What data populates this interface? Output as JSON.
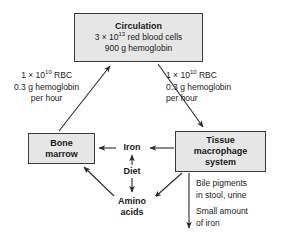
{
  "diagram": {
    "stroke_color": "#2b2b2b",
    "box_fill_color": "#e6e6e6",
    "box_border_color": "#3a3a3a",
    "background_color": "#ffffff"
  },
  "nodes": {
    "circulation": {
      "title": "Circulation",
      "line1_prefix": "3 × 10",
      "line1_exp": "13",
      "line1_suffix": " red blood cells",
      "line2": "900 g hemoglobin"
    },
    "bone_marrow": {
      "line1": "Bone",
      "line2": "marrow"
    },
    "macrophage": {
      "line1": "Tissue",
      "line2": "macrophage",
      "line3": "system"
    },
    "iron": "Iron",
    "diet": "Diet",
    "amino_acids_line1": "Amino",
    "amino_acids_line2": "acids"
  },
  "flux_labels": {
    "left": {
      "line1_prefix": "1 × 10",
      "line1_exp": "10",
      "line1_suffix": " RBC",
      "line2": "0.3 g hemoglobin",
      "line3": "per hour"
    },
    "right": {
      "line1_prefix": "1 × 10",
      "line1_exp": "10",
      "line1_suffix": " RBC",
      "line2": "0.3 g hemoglobin",
      "line3": "per hour"
    }
  },
  "outputs": {
    "bile_line1": "Bile pigments",
    "bile_line2": "in stool, urine",
    "iron_loss_line1": "Small amount",
    "iron_loss_line2": "of iron"
  }
}
